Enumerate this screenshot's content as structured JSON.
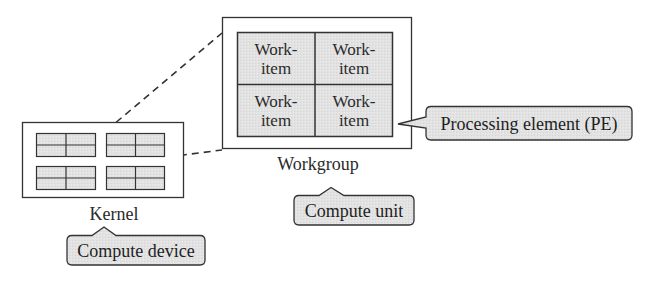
{
  "diagram": {
    "colors": {
      "stroke": "#333333",
      "cell_fill": "#e4e4e4",
      "callout_fill": "#e8e8e8",
      "background": "#ffffff"
    },
    "kernel": {
      "label": "Kernel",
      "workgroup_count": 4,
      "cells_per_workgroup": 4
    },
    "workgroup": {
      "label": "Workgroup",
      "work_items": [
        {
          "line1": "Work-",
          "line2": "item"
        },
        {
          "line1": "Work-",
          "line2": "item"
        },
        {
          "line1": "Work-",
          "line2": "item"
        },
        {
          "line1": "Work-",
          "line2": "item"
        }
      ]
    },
    "callouts": {
      "compute_device": "Compute device",
      "compute_unit": "Compute unit",
      "processing_element": "Processing element (PE)"
    },
    "edges": [
      {
        "from": "kernel-workgroup-top-right",
        "to": "workgroup-box-top-left",
        "style": "dashed"
      },
      {
        "from": "kernel-workgroup-bottom-right-edge",
        "to": "workgroup-box-bottom-left",
        "style": "dashed"
      }
    ]
  }
}
